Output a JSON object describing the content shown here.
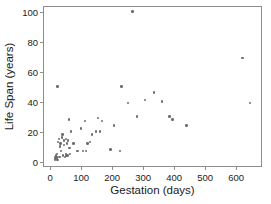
{
  "chart_data": {
    "type": "scatter",
    "title": "",
    "xlabel": "Gestation (days)",
    "ylabel": "Life Span (years)",
    "xlim": [
      -20,
      680
    ],
    "ylim": [
      -3,
      103
    ],
    "xticks": [
      0,
      100,
      200,
      300,
      400,
      500,
      600
    ],
    "yticks": [
      0,
      20,
      40,
      60,
      80,
      100
    ],
    "grid": false,
    "legend": null,
    "marker_color": "#6e6e6e",
    "axis_color": "#8d8d8d",
    "series": [
      {
        "name": "Mammals",
        "points": [
          [
            15,
            1
          ],
          [
            16,
            3
          ],
          [
            17,
            2
          ],
          [
            19,
            4
          ],
          [
            20,
            3
          ],
          [
            21,
            2
          ],
          [
            21,
            5
          ],
          [
            22,
            3
          ],
          [
            23,
            1
          ],
          [
            24,
            50
          ],
          [
            25,
            13
          ],
          [
            28,
            15
          ],
          [
            30,
            3
          ],
          [
            31,
            10
          ],
          [
            33,
            12
          ],
          [
            35,
            7
          ],
          [
            38,
            16
          ],
          [
            40,
            18
          ],
          [
            42,
            4
          ],
          [
            44,
            14
          ],
          [
            45,
            11
          ],
          [
            48,
            3
          ],
          [
            50,
            5
          ],
          [
            50,
            15
          ],
          [
            52,
            4
          ],
          [
            54,
            12
          ],
          [
            56,
            4
          ],
          [
            58,
            14
          ],
          [
            60,
            28
          ],
          [
            62,
            9
          ],
          [
            63,
            5
          ],
          [
            68,
            20
          ],
          [
            75,
            12
          ],
          [
            88,
            7
          ],
          [
            100,
            22
          ],
          [
            105,
            7
          ],
          [
            112,
            27
          ],
          [
            115,
            7
          ],
          [
            120,
            12
          ],
          [
            128,
            13
          ],
          [
            135,
            18
          ],
          [
            148,
            20
          ],
          [
            155,
            29
          ],
          [
            160,
            20
          ],
          [
            168,
            27
          ],
          [
            195,
            8
          ],
          [
            205,
            24
          ],
          [
            225,
            7
          ],
          [
            230,
            50
          ],
          [
            250,
            39
          ],
          [
            265,
            100
          ],
          [
            280,
            30
          ],
          [
            305,
            41
          ],
          [
            335,
            46
          ],
          [
            360,
            40
          ],
          [
            385,
            30
          ],
          [
            395,
            28
          ],
          [
            440,
            24
          ],
          [
            620,
            69
          ],
          [
            645,
            39
          ]
        ]
      }
    ]
  }
}
